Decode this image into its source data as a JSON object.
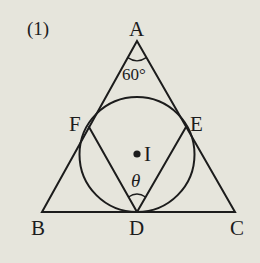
{
  "problem_label": "(1)",
  "points": {
    "A": {
      "label": "A",
      "x": 137,
      "y": 41
    },
    "B": {
      "label": "B",
      "x": 42,
      "y": 212
    },
    "C": {
      "label": "C",
      "x": 235,
      "y": 212
    },
    "D": {
      "label": "D",
      "x": 137,
      "y": 212
    },
    "E": {
      "label": "E",
      "x": 186,
      "y": 127
    },
    "F": {
      "label": "F",
      "x": 89,
      "y": 127
    },
    "I": {
      "label": "I",
      "x": 137,
      "y": 154
    }
  },
  "incircle": {
    "center": "I",
    "radius": 57.5
  },
  "angles": {
    "A": {
      "label": "60°"
    },
    "D": {
      "label": "θ"
    }
  },
  "colors": {
    "background": "#e6e5dc",
    "ink": "#1c1c1c"
  }
}
